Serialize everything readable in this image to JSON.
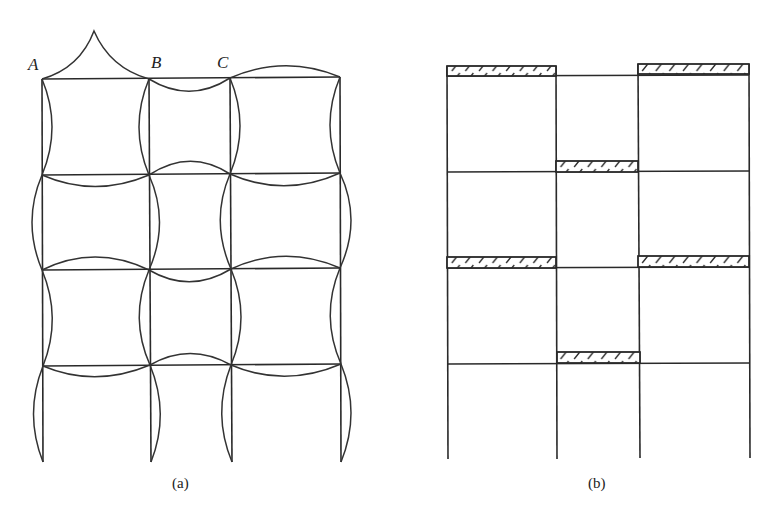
{
  "figure": {
    "panels": [
      {
        "id": "a",
        "caption": "(a)",
        "description": "Deflected shape of a 3-bay, 4-story frame under checkerboard loading",
        "node_labels": [
          "A",
          "B",
          "C"
        ]
      },
      {
        "id": "b",
        "caption": "(b)",
        "description": "Checkerboard live-load pattern on a 3-bay, 4-story frame (hatched bays loaded)",
        "loaded_bays": [
          {
            "story": 4,
            "bay": 1
          },
          {
            "story": 4,
            "bay": 3
          },
          {
            "story": 3,
            "bay": 2
          },
          {
            "story": 2,
            "bay": 1
          },
          {
            "story": 2,
            "bay": 3
          },
          {
            "story": 1,
            "bay": 2
          }
        ]
      }
    ]
  },
  "colors": {
    "line": "#2a2a2a",
    "background": "#ffffff"
  }
}
